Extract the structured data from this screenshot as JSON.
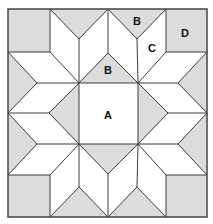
{
  "diagram": {
    "type": "quilt-block",
    "labels": {
      "A": "A",
      "B_top": "B",
      "B_center": "B",
      "C": "C",
      "D": "D"
    },
    "colors": {
      "shaded": "#dcdcdc",
      "background": "#ffffff",
      "line": "#3a3a3a"
    }
  }
}
